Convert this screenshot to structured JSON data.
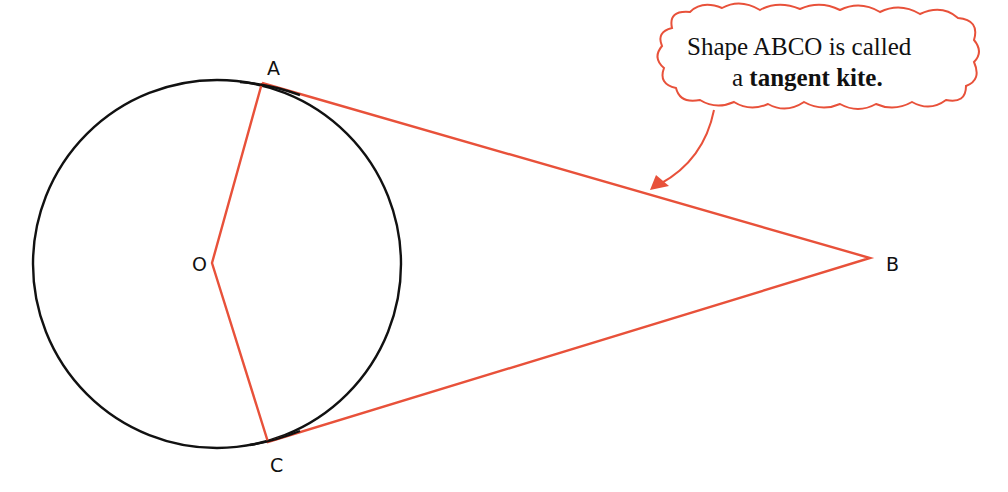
{
  "figure": {
    "type": "geometry-diagram",
    "colors": {
      "circle": "#111111",
      "kite": "#e8513a",
      "callout": "#e8513a",
      "background": "#ffffff"
    },
    "circle": {
      "center_label": "O",
      "cx": 217,
      "cy": 264,
      "r": 184
    },
    "points": {
      "A": {
        "label": "A",
        "x": 262,
        "y": 83
      },
      "B": {
        "label": "B",
        "x": 870,
        "y": 258
      },
      "C": {
        "label": "C",
        "x": 268,
        "y": 442
      },
      "O": {
        "label": "O",
        "x": 212,
        "y": 263
      }
    },
    "callout": {
      "line1": "Shape ABCO is called",
      "line2_prefix": "a ",
      "line2_bold": "tangent kite",
      "line2_suffix": "."
    }
  }
}
